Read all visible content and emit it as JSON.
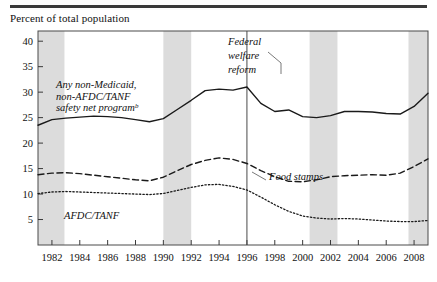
{
  "figure": {
    "axis_title": "Percent of total population",
    "top_rule_color": "#3a3a3a"
  },
  "chart_data": {
    "type": "line",
    "title": "",
    "subtitle": "",
    "xlabel": "",
    "ylabel": "Percent of total population",
    "xlim": [
      1981,
      2009
    ],
    "ylim": [
      0,
      42
    ],
    "ytick_labels": [
      "5",
      "10",
      "15",
      "20",
      "25",
      "30",
      "35",
      "40"
    ],
    "yticks": [
      5,
      10,
      15,
      20,
      25,
      30,
      35,
      40
    ],
    "xtick_labels": [
      "1982",
      "1984",
      "1986",
      "1988",
      "1990",
      "1992",
      "1994",
      "1996",
      "1998",
      "2000",
      "2002",
      "2004",
      "2006",
      "2008"
    ],
    "xticks": [
      1982,
      1984,
      1986,
      1988,
      1990,
      1992,
      1994,
      1996,
      1998,
      2000,
      2002,
      2004,
      2006,
      2008
    ],
    "grid": false,
    "legend_position": "inline-annotations",
    "x": [
      1981,
      1982,
      1983,
      1984,
      1985,
      1986,
      1987,
      1988,
      1989,
      1990,
      1991,
      1992,
      1993,
      1994,
      1995,
      1996,
      1997,
      1998,
      1999,
      2000,
      2001,
      2002,
      2003,
      2004,
      2005,
      2006,
      2007,
      2008,
      2009
    ],
    "series": [
      {
        "name": "Any non-Medicaid, non-AFDC/TANF safety net program",
        "style": "solid",
        "color": "#1a1a1a",
        "values": [
          23.5,
          24.6,
          24.9,
          25.1,
          25.3,
          25.2,
          25.0,
          24.6,
          24.2,
          24.8,
          26.6,
          28.4,
          30.3,
          30.6,
          30.4,
          31.0,
          27.8,
          26.2,
          26.5,
          25.2,
          25.0,
          25.4,
          26.2,
          26.2,
          26.1,
          25.8,
          25.7,
          27.2,
          29.8
        ]
      },
      {
        "name": "Food stamps",
        "style": "dashed",
        "color": "#1a1a1a",
        "values": [
          13.8,
          14.1,
          14.2,
          14.0,
          13.7,
          13.4,
          13.1,
          12.8,
          12.6,
          13.3,
          14.6,
          15.8,
          16.6,
          17.1,
          16.8,
          16.0,
          14.6,
          13.4,
          12.5,
          12.4,
          12.8,
          13.4,
          13.6,
          13.7,
          13.8,
          13.7,
          14.1,
          15.4,
          16.9
        ]
      },
      {
        "name": "AFDC/TANF",
        "style": "dotted",
        "color": "#1a1a1a",
        "values": [
          10.1,
          10.4,
          10.5,
          10.4,
          10.3,
          10.2,
          10.1,
          10.0,
          9.9,
          10.1,
          10.7,
          11.3,
          11.8,
          11.9,
          11.5,
          10.8,
          9.4,
          7.9,
          6.6,
          5.7,
          5.3,
          5.1,
          5.2,
          5.1,
          4.9,
          4.7,
          4.6,
          4.6,
          4.8
        ]
      }
    ],
    "annotations": [
      {
        "name": "safety-net-label",
        "lines": [
          "Any non-Medicaid,",
          "non-AFDC/TANF",
          "safety net program"
        ],
        "superscript": "b"
      },
      {
        "name": "federal-welfare-reform-label",
        "lines": [
          "Federal",
          "welfare",
          "reform"
        ],
        "marker_year": 1996
      },
      {
        "name": "food-stamps-label",
        "lines": [
          "Food stamps"
        ]
      },
      {
        "name": "afdc-tanf-label",
        "lines": [
          "AFDC/TANF"
        ]
      }
    ],
    "shaded_bands": [
      {
        "name": "recession-1981-1982",
        "start": 1981.0,
        "end": 1982.9
      },
      {
        "name": "recession-1990-1991",
        "start": 1990.0,
        "end": 1992.0
      },
      {
        "name": "recession-2001",
        "start": 2000.5,
        "end": 2002.5
      },
      {
        "name": "recession-2007-2009",
        "start": 2007.6,
        "end": 2009.0
      }
    ],
    "band_color": "#dcdcdc",
    "vertical_marker": {
      "name": "federal-welfare-reform-line",
      "year": 1996,
      "color": "#4a4a4a"
    }
  }
}
